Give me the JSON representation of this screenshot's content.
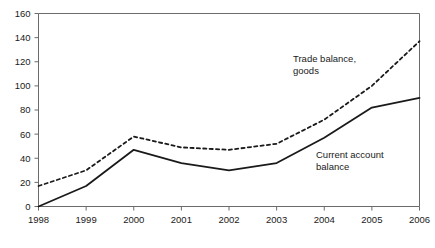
{
  "chart_data": {
    "type": "line",
    "title": "",
    "subtitle": "",
    "xlabel": "",
    "ylabel": "",
    "categories": [
      "1998",
      "1999",
      "2000",
      "2001",
      "2002",
      "2003",
      "2004",
      "2005",
      "2006"
    ],
    "x": [
      1998,
      1999,
      2000,
      2001,
      2002,
      2003,
      2004,
      2005,
      2006
    ],
    "xlim": [
      1998,
      2006
    ],
    "ylim": [
      0,
      160
    ],
    "y_ticks": [
      0,
      20,
      40,
      60,
      80,
      100,
      120,
      140,
      160
    ],
    "x_ticks": [
      "1998",
      "1999",
      "2000",
      "2001",
      "2002",
      "2003",
      "2004",
      "2005",
      "2006"
    ],
    "grid": false,
    "legend_position": "inline-annotations",
    "series": [
      {
        "name": "Trade balance, goods",
        "style": "dashed",
        "color": "#1a1a1a",
        "values": [
          17,
          30,
          58,
          49,
          47,
          52,
          72,
          100,
          137
        ]
      },
      {
        "name": "Current account balance",
        "style": "solid",
        "color": "#1a1a1a",
        "values": [
          0,
          17,
          47,
          36,
          30,
          36,
          57,
          82,
          90
        ]
      }
    ],
    "annotations": [
      {
        "id": "trade-balance-goods",
        "lines": [
          "Trade balance,",
          "goods"
        ],
        "x_px": 293,
        "y_px": 62
      },
      {
        "id": "current-account-balance",
        "lines": [
          "Current account",
          "balance"
        ],
        "x_px": 316,
        "y_px": 158
      }
    ]
  },
  "axis": {
    "y_tick_labels": [
      "160",
      "140",
      "120",
      "100",
      "80",
      "60",
      "40",
      "20",
      "0"
    ],
    "x_tick_labels": [
      "1998",
      "1999",
      "2000",
      "2001",
      "2002",
      "2003",
      "2004",
      "2005",
      "2006"
    ]
  },
  "colors": {
    "line": "#1a1a1a",
    "frame": "#6b6b6b",
    "text": "#1a1a1a",
    "background": "#ffffff"
  }
}
